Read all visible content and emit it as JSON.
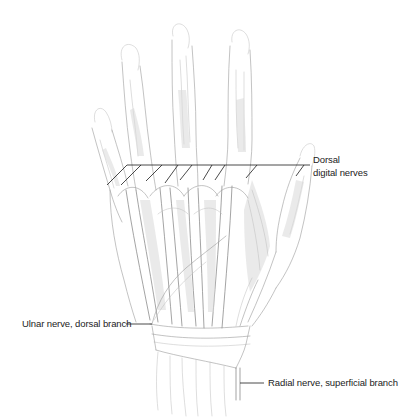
{
  "figure": {
    "labels": {
      "dorsal_digital_line1": "Dorsal",
      "dorsal_digital_line2": "digital nerves",
      "ulnar": "Ulnar nerve, dorsal branch",
      "radial": "Radial nerve, superficial branch"
    },
    "colors": {
      "background": "#ffffff",
      "label_text": "#222222",
      "leader_line": "#1c1c1c",
      "drawing_stroke": "#9a9a9a"
    }
  }
}
